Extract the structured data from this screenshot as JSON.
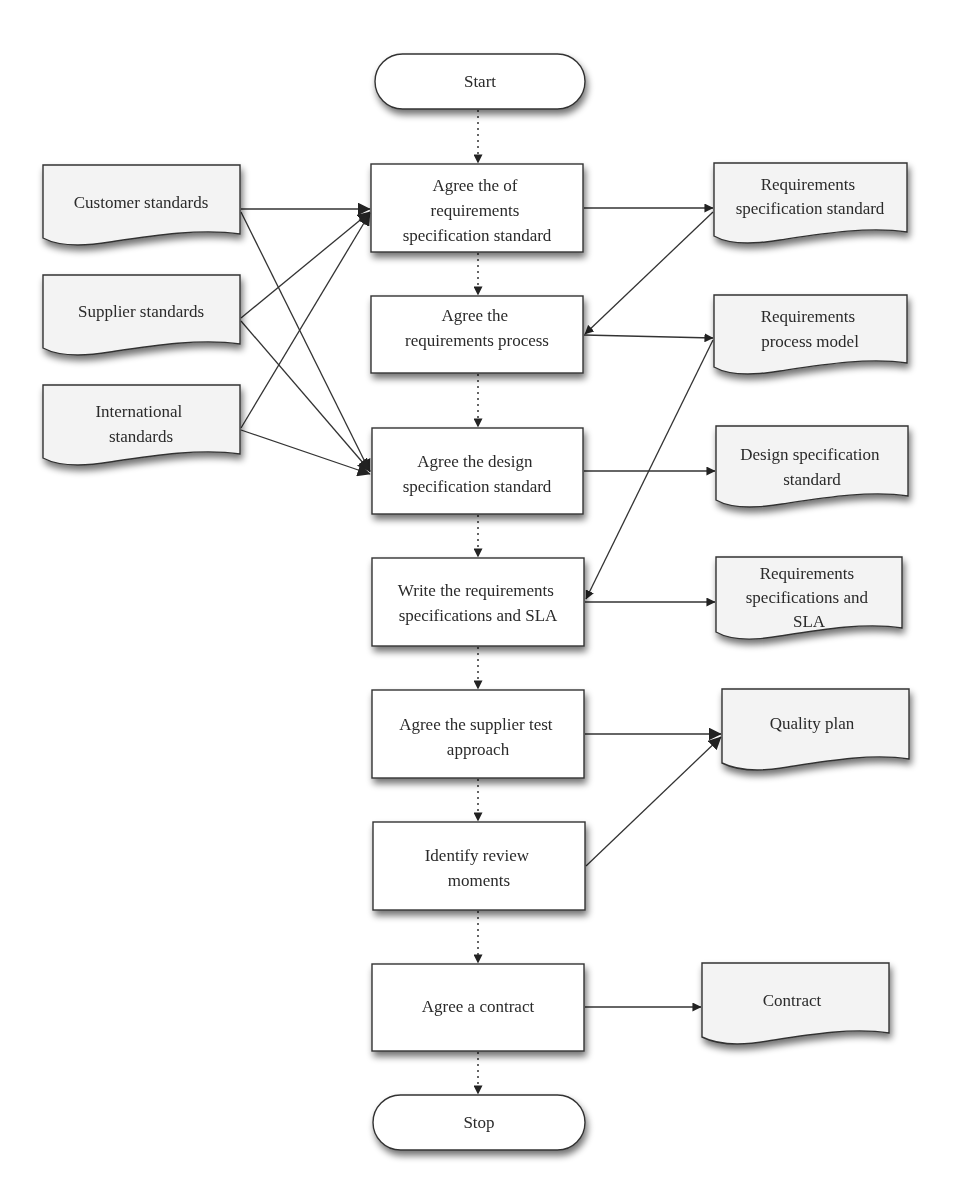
{
  "diagram": {
    "type": "flowchart",
    "terminals": {
      "start": {
        "label": "Start"
      },
      "stop": {
        "label": "Stop"
      }
    },
    "process_steps": [
      {
        "id": "p1",
        "lines": [
          "Agree the of",
          "requirements",
          "specification standard"
        ]
      },
      {
        "id": "p2",
        "lines": [
          "Agree the",
          "requirements process"
        ]
      },
      {
        "id": "p3",
        "lines": [
          "Agree the design",
          "specification standard"
        ]
      },
      {
        "id": "p4",
        "lines": [
          "Write the requirements",
          "specifications and SLA"
        ]
      },
      {
        "id": "p5",
        "lines": [
          "Agree the supplier test",
          "approach"
        ]
      },
      {
        "id": "p6",
        "lines": [
          "Identify review",
          "moments"
        ]
      },
      {
        "id": "p7",
        "lines": [
          "Agree a contract"
        ]
      }
    ],
    "input_documents": [
      {
        "id": "in1",
        "lines": [
          "Customer standards"
        ]
      },
      {
        "id": "in2",
        "lines": [
          "Supplier standards"
        ]
      },
      {
        "id": "in3",
        "lines": [
          "International",
          "standards"
        ]
      }
    ],
    "output_documents": [
      {
        "id": "out1",
        "lines": [
          "Requirements",
          "specification standard"
        ]
      },
      {
        "id": "out2",
        "lines": [
          "Requirements",
          "process model"
        ]
      },
      {
        "id": "out3",
        "lines": [
          "Design specification",
          "standard"
        ]
      },
      {
        "id": "out4",
        "lines": [
          "Requirements",
          "specifications and",
          "SLA"
        ]
      },
      {
        "id": "out5",
        "lines": [
          "Quality plan"
        ]
      },
      {
        "id": "out6",
        "lines": [
          "Contract"
        ]
      }
    ],
    "edges": [
      {
        "from": "start",
        "to": "p1",
        "style": "dotted"
      },
      {
        "from": "p1",
        "to": "p2",
        "style": "dotted"
      },
      {
        "from": "p2",
        "to": "p3",
        "style": "dotted"
      },
      {
        "from": "p3",
        "to": "p4",
        "style": "dotted"
      },
      {
        "from": "p4",
        "to": "p5",
        "style": "dotted"
      },
      {
        "from": "p5",
        "to": "p6",
        "style": "dotted"
      },
      {
        "from": "p6",
        "to": "p7",
        "style": "dotted"
      },
      {
        "from": "p7",
        "to": "stop",
        "style": "dotted"
      },
      {
        "from": "in1",
        "to": "p1",
        "style": "solid"
      },
      {
        "from": "in1",
        "to": "p3",
        "style": "solid"
      },
      {
        "from": "in2",
        "to": "p1",
        "style": "solid"
      },
      {
        "from": "in2",
        "to": "p3",
        "style": "solid"
      },
      {
        "from": "in3",
        "to": "p1",
        "style": "solid"
      },
      {
        "from": "in3",
        "to": "p3",
        "style": "solid"
      },
      {
        "from": "p1",
        "to": "out1",
        "style": "solid"
      },
      {
        "from": "out1",
        "to": "p2",
        "style": "solid"
      },
      {
        "from": "p2",
        "to": "out2",
        "style": "solid"
      },
      {
        "from": "out2",
        "to": "p4",
        "style": "solid"
      },
      {
        "from": "p3",
        "to": "out3",
        "style": "solid"
      },
      {
        "from": "p4",
        "to": "out4",
        "style": "solid"
      },
      {
        "from": "p5",
        "to": "out5",
        "style": "solid"
      },
      {
        "from": "p6",
        "to": "out5",
        "style": "solid"
      },
      {
        "from": "p7",
        "to": "out6",
        "style": "solid"
      }
    ]
  },
  "colors": {
    "stroke": "#333333",
    "process_fill": "#ffffff",
    "document_fill": "#f3f3f3",
    "shadow": "#9a9a9a"
  }
}
